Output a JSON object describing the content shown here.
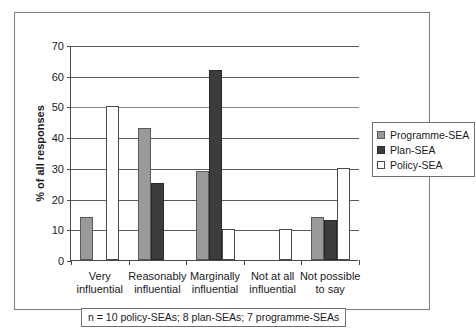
{
  "chart_data": {
    "type": "bar",
    "title": "",
    "subtitle": "",
    "xlabel": "",
    "ylabel": "% of all responses",
    "ylim": [
      0,
      70
    ],
    "yticks": [
      0,
      10,
      20,
      30,
      40,
      50,
      60,
      70
    ],
    "grid": true,
    "legend_position": "right",
    "categories": [
      "Very influential",
      "Reasonably influential",
      "Marginally influential",
      "Not at all influential",
      "Not possible to say"
    ],
    "category_lines": [
      [
        "Very",
        "influential"
      ],
      [
        "Reasonably",
        "influential"
      ],
      [
        "Marginally",
        "influential"
      ],
      [
        "Not at all",
        "influential"
      ],
      [
        "Not possible",
        "to say"
      ]
    ],
    "series": [
      {
        "name": "Programme-SEA",
        "color": "#9a9a9a",
        "values": [
          14,
          43,
          29,
          0,
          14
        ]
      },
      {
        "name": "Plan-SEA",
        "color": "#3c3c3c",
        "values": [
          0,
          25,
          62,
          0,
          13
        ]
      },
      {
        "name": "Policy-SEA",
        "color": "#ffffff",
        "values": [
          50,
          0,
          10,
          10,
          30
        ]
      }
    ],
    "annotations": [
      "n = 10 policy-SEAs; 8 plan-SEAs; 7 programme-SEAs"
    ]
  },
  "legend": {
    "items": [
      {
        "label": "Programme-SEA"
      },
      {
        "label": "Plan-SEA"
      },
      {
        "label": "Policy-SEA"
      }
    ]
  },
  "footnote": {
    "text": "n = 10 policy-SEAs; 8 plan-SEAs; 7 programme-SEAs"
  }
}
